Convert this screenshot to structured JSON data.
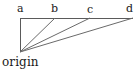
{
  "figure": {
    "type": "geometry-diagram",
    "background_color": "#ffffff",
    "stroke_color": "#5a5a5a",
    "text_color": "#1a1a1a",
    "stroke_width": 1,
    "labels": {
      "a": "a",
      "b": "b",
      "c": "c",
      "d": "d",
      "origin": "origin"
    },
    "points": {
      "origin": {
        "x": 20,
        "y": 52
      },
      "a": {
        "x": 20,
        "y": 18
      },
      "b": {
        "x": 55,
        "y": 18
      },
      "c": {
        "x": 90,
        "y": 18
      },
      "d": {
        "x": 133,
        "y": 18
      }
    },
    "segments": [
      {
        "name": "vertical-side-origin-a",
        "x1": 20,
        "y1": 52,
        "x2": 20,
        "y2": 18
      },
      {
        "name": "horizontal-side-a-d",
        "x1": 20,
        "y1": 18,
        "x2": 133,
        "y2": 18
      },
      {
        "name": "ray-origin-b",
        "x1": 20,
        "y1": 52,
        "x2": 55,
        "y2": 18
      },
      {
        "name": "ray-origin-c",
        "x1": 20,
        "y1": 52,
        "x2": 90,
        "y2": 18
      },
      {
        "name": "ray-origin-d",
        "x1": 20,
        "y1": 52,
        "x2": 133,
        "y2": 18
      }
    ]
  }
}
